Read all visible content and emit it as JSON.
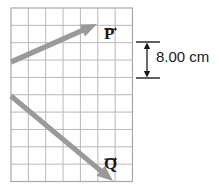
{
  "figure": {
    "background_color": "#ffffff",
    "grid": {
      "x": 11,
      "y": 8,
      "columns": 7,
      "rows": 10,
      "cell_size": 17.35,
      "line_color": "#b8b8b8",
      "border_color": "#a8a8a8",
      "fill_color": "#ffffff"
    },
    "vectors": [
      {
        "name": "P",
        "label": "P",
        "label_icon": "vector-arrow-overbar",
        "color": "#9a9a9a",
        "start": {
          "x": 11,
          "y": 62
        },
        "end": {
          "x": 97,
          "y": 24
        },
        "direction": "up-right"
      },
      {
        "name": "Q",
        "label": "Q",
        "label_icon": "vector-arrow-overbar",
        "color": "#9a9a9a",
        "start": {
          "x": 11,
          "y": 96
        },
        "end": {
          "x": 113,
          "y": 181
        },
        "direction": "down-right"
      }
    ],
    "dimension": {
      "label": "8.00 cm",
      "value": 8.0,
      "unit": "cm",
      "icon": "double-headed-arrow-vertical",
      "color": "#1a1a1a",
      "top_y": 42,
      "bottom_y": 78,
      "x": 147,
      "cap_half_width": 11,
      "spans_cells": 2
    }
  }
}
